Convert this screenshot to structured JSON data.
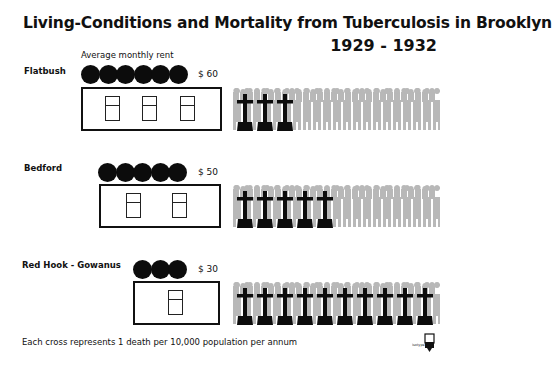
{
  "title": "Living-Conditions and Mortality from Tuberculosis in Brooklyn",
  "years": "1929 - 1932",
  "rent_caption": "Average monthly rent",
  "footnote": "Each cross represents 1 death per 10,000 population per annum",
  "logo_label": "isotype",
  "colors": {
    "ink": "#0c0c0c",
    "people": "#b8b8b8",
    "background": "#ffffff"
  },
  "regions": [
    {
      "name": "Flatbush",
      "rent": "$ 60",
      "coins": 6,
      "windows": 3,
      "crosses": 3
    },
    {
      "name": "Bedford",
      "rent": "$ 50",
      "coins": 5,
      "windows": 2,
      "crosses": 5
    },
    {
      "name": "Red Hook - Gowanus",
      "rent": "$ 30",
      "coins": 3,
      "windows": 1,
      "crosses": 10
    }
  ],
  "chart_data": {
    "type": "bar",
    "categories": [
      "Flatbush",
      "Bedford",
      "Red Hook - Gowanus"
    ],
    "series": [
      {
        "name": "Average monthly rent ($)",
        "values": [
          60,
          50,
          30
        ],
        "unit_symbol": "coin = $10"
      },
      {
        "name": "Tuberculosis deaths per 10,000 population per annum",
        "values": [
          3,
          5,
          10
        ],
        "unit_symbol": "cross = 1 death per 10,000"
      },
      {
        "name": "Windows per dwelling (symbolic)",
        "values": [
          3,
          2,
          1
        ]
      }
    ],
    "annotations": [
      "Average monthly rent",
      "Each cross represents 1 death per 10,000 population per annum"
    ],
    "xlabel": "",
    "ylabel": ""
  }
}
